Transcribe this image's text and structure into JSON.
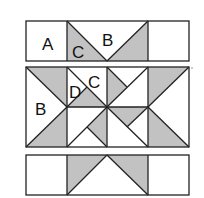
{
  "diagram": {
    "colors": {
      "shaded": "#c2c2c2",
      "unshaded": "#ffffff",
      "outline": "#222222"
    },
    "rows": [
      {
        "name": "top-strip",
        "labels": {
          "A": "A",
          "C": "C",
          "B": "B"
        }
      },
      {
        "name": "center-block",
        "labels": {
          "B": "B",
          "D": "D",
          "C": "C"
        }
      },
      {
        "name": "bottom-strip",
        "labels": {}
      }
    ],
    "piece_labels": [
      "A",
      "B",
      "C",
      "D"
    ]
  }
}
